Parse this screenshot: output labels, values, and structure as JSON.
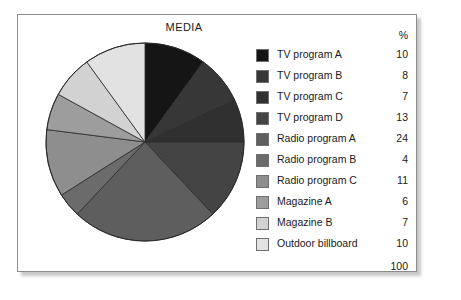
{
  "panel": {
    "title": "MEDIA",
    "percent_header": "%",
    "total": "100"
  },
  "chart_data": {
    "type": "pie",
    "title": "MEDIA",
    "xlabel": "",
    "ylabel": "",
    "value_unit": "%",
    "total": 100,
    "start_angle_deg": 0,
    "direction": "clockwise",
    "legend_position": "right",
    "grid": false,
    "categories": [
      "TV program A",
      "TV program B",
      "TV program C",
      "TV program D",
      "Radio program A",
      "Radio program B",
      "Radio program C",
      "Magazine A",
      "Magazine B",
      "Outdoor billboard"
    ],
    "values": [
      10,
      8,
      7,
      13,
      24,
      4,
      11,
      6,
      7,
      10
    ],
    "colors": [
      "#151515",
      "#373737",
      "#303030",
      "#444444",
      "#5e5e5e",
      "#6b6b6b",
      "#8e8e8e",
      "#9d9d9d",
      "#d2d2d2",
      "#e2e2e2"
    ]
  },
  "legend": {
    "items": [
      {
        "label": "TV program A",
        "value": "10",
        "color": "#151515"
      },
      {
        "label": "TV program B",
        "value": "8",
        "color": "#373737"
      },
      {
        "label": "TV program C",
        "value": "7",
        "color": "#303030"
      },
      {
        "label": "TV program D",
        "value": "13",
        "color": "#444444"
      },
      {
        "label": "Radio program A",
        "value": "24",
        "color": "#5e5e5e"
      },
      {
        "label": "Radio program B",
        "value": "4",
        "color": "#6b6b6b"
      },
      {
        "label": "Radio program C",
        "value": "11",
        "color": "#8e8e8e"
      },
      {
        "label": "Magazine A",
        "value": "6",
        "color": "#9d9d9d"
      },
      {
        "label": "Magazine B",
        "value": "7",
        "color": "#d2d2d2"
      },
      {
        "label": "Outdoor billboard",
        "value": "10",
        "color": "#e2e2e2"
      }
    ]
  }
}
